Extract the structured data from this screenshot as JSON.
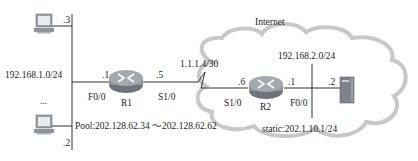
{
  "cloud": {
    "label": "Internet"
  },
  "lan_left": {
    "network": "192.168.1.0/24",
    "ellipsis": "...",
    "hosts": [
      {
        "name": "PC-top",
        "host_id": ".3"
      },
      {
        "name": "PC-bottom",
        "host_id": ".2"
      }
    ]
  },
  "r1": {
    "name": "R1",
    "f0_0": {
      "iface": "F0/0",
      "host_id": ".1"
    },
    "s1_0": {
      "iface": "S1/0",
      "host_id": ".5"
    }
  },
  "wan_link": {
    "network": "1.1.1.4/30"
  },
  "r2": {
    "name": "R2",
    "s1_0": {
      "iface": "S1/0",
      "host_id": ".6"
    },
    "f0_0": {
      "iface": "F0/0",
      "host_id": ".1"
    }
  },
  "lan_right": {
    "network": "192.168.2.0/24",
    "server": {
      "host_id": ".2"
    },
    "static": "static:202.1.10.1/24"
  },
  "nat_pool": "Pool:202.128.62.34 ～202.128.62.62",
  "colors": {
    "cloud_stroke": "#c8c8c8",
    "router_fill": "#8e9299",
    "server_fill": "#8a8f96",
    "line": "#333333"
  }
}
